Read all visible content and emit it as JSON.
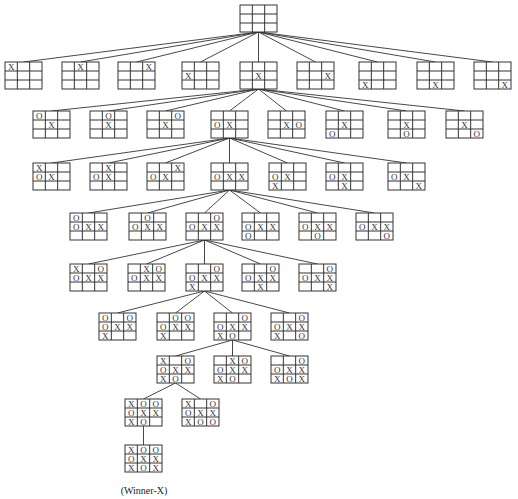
{
  "caption": "(Winner-X)",
  "colors": {
    "line": "#333333",
    "mark": "#333333",
    "background": "#ffffff"
  },
  "levels": [
    {
      "boards": [
        {
          "id": "root",
          "cells": [
            "",
            "",
            "",
            "",
            "",
            "",
            "",
            "",
            ""
          ]
        }
      ]
    },
    {
      "parent": "root",
      "boards": [
        {
          "id": "L1-0",
          "cells": [
            "X",
            "",
            "",
            "",
            "",
            "",
            "",
            "",
            ""
          ]
        },
        {
          "id": "L1-1",
          "cells": [
            "",
            "X",
            "",
            "",
            "",
            "",
            "",
            "",
            ""
          ]
        },
        {
          "id": "L1-2",
          "cells": [
            "",
            "",
            "X",
            "",
            "",
            "",
            "",
            "",
            ""
          ]
        },
        {
          "id": "L1-3",
          "cells": [
            "",
            "",
            "",
            "X",
            "",
            "",
            "",
            "",
            ""
          ]
        },
        {
          "id": "L1-4",
          "cells": [
            "",
            "",
            "",
            "",
            "X",
            "",
            "",
            "",
            ""
          ]
        },
        {
          "id": "L1-5",
          "cells": [
            "",
            "",
            "",
            "",
            "",
            "X",
            "",
            "",
            ""
          ]
        },
        {
          "id": "L1-6",
          "cells": [
            "",
            "",
            "",
            "",
            "",
            "",
            "X",
            "",
            ""
          ]
        },
        {
          "id": "L1-7",
          "cells": [
            "",
            "",
            "",
            "",
            "",
            "",
            "",
            "X",
            ""
          ]
        },
        {
          "id": "L1-8",
          "cells": [
            "",
            "",
            "",
            "",
            "",
            "",
            "",
            "",
            "X"
          ]
        }
      ]
    },
    {
      "parent": "L1-4",
      "boards": [
        {
          "id": "L2-0",
          "cells": [
            "O",
            "",
            "",
            "",
            "X",
            "",
            "",
            "",
            ""
          ]
        },
        {
          "id": "L2-1",
          "cells": [
            "",
            "O",
            "",
            "",
            "X",
            "",
            "",
            "",
            ""
          ]
        },
        {
          "id": "L2-2",
          "cells": [
            "",
            "",
            "O",
            "",
            "X",
            "",
            "",
            "",
            ""
          ]
        },
        {
          "id": "L2-3",
          "cells": [
            "",
            "",
            "",
            "O",
            "X",
            "",
            "",
            "",
            ""
          ]
        },
        {
          "id": "L2-4",
          "cells": [
            "",
            "",
            "",
            "",
            "X",
            "O",
            "",
            "",
            ""
          ]
        },
        {
          "id": "L2-5",
          "cells": [
            "",
            "",
            "",
            "",
            "X",
            "",
            "O",
            "",
            ""
          ]
        },
        {
          "id": "L2-6",
          "cells": [
            "",
            "",
            "",
            "",
            "X",
            "",
            "",
            "O",
            ""
          ]
        },
        {
          "id": "L2-7",
          "cells": [
            "",
            "",
            "",
            "",
            "X",
            "",
            "",
            "",
            "O"
          ]
        }
      ]
    },
    {
      "parent": "L2-3",
      "boards": [
        {
          "id": "L3-0",
          "cells": [
            "X",
            "",
            "",
            "O",
            "X",
            "",
            "",
            "",
            ""
          ]
        },
        {
          "id": "L3-1",
          "cells": [
            "",
            "X",
            "",
            "O",
            "X",
            "",
            "",
            "",
            ""
          ]
        },
        {
          "id": "L3-2",
          "cells": [
            "",
            "",
            "X",
            "O",
            "X",
            "",
            "",
            "",
            ""
          ]
        },
        {
          "id": "L3-3",
          "cells": [
            "",
            "",
            "",
            "O",
            "X",
            "X",
            "",
            "",
            ""
          ]
        },
        {
          "id": "L3-4",
          "cells": [
            "",
            "",
            "",
            "O",
            "X",
            "",
            "X",
            "",
            ""
          ]
        },
        {
          "id": "L3-5",
          "cells": [
            "",
            "",
            "",
            "O",
            "X",
            "",
            "",
            "X",
            ""
          ]
        },
        {
          "id": "L3-6",
          "cells": [
            "",
            "",
            "",
            "O",
            "X",
            "",
            "",
            "",
            "X"
          ]
        }
      ]
    },
    {
      "parent": "L3-3",
      "boards": [
        {
          "id": "L4-0",
          "cells": [
            "O",
            "",
            "",
            "O",
            "X",
            "X",
            "",
            "",
            ""
          ]
        },
        {
          "id": "L4-1",
          "cells": [
            "",
            "O",
            "",
            "O",
            "X",
            "X",
            "",
            "",
            ""
          ]
        },
        {
          "id": "L4-2",
          "cells": [
            "",
            "",
            "O",
            "O",
            "X",
            "X",
            "",
            "",
            ""
          ]
        },
        {
          "id": "L4-3",
          "cells": [
            "",
            "",
            "",
            "O",
            "X",
            "X",
            "O",
            "",
            ""
          ]
        },
        {
          "id": "L4-4",
          "cells": [
            "",
            "",
            "",
            "O",
            "X",
            "X",
            "",
            "O",
            ""
          ]
        },
        {
          "id": "L4-5",
          "cells": [
            "",
            "",
            "",
            "O",
            "X",
            "X",
            "",
            "",
            "O"
          ]
        }
      ]
    },
    {
      "parent": "L4-2",
      "boards": [
        {
          "id": "L5-0",
          "cells": [
            "X",
            "",
            "O",
            "O",
            "X",
            "X",
            "",
            "",
            ""
          ]
        },
        {
          "id": "L5-1",
          "cells": [
            "",
            "X",
            "O",
            "O",
            "X",
            "X",
            "",
            "",
            ""
          ]
        },
        {
          "id": "L5-2",
          "cells": [
            "",
            "",
            "O",
            "O",
            "X",
            "X",
            "X",
            "",
            ""
          ]
        },
        {
          "id": "L5-3",
          "cells": [
            "",
            "",
            "O",
            "O",
            "X",
            "X",
            "",
            "X",
            ""
          ]
        },
        {
          "id": "L5-4",
          "cells": [
            "",
            "",
            "O",
            "O",
            "X",
            "X",
            "",
            "",
            "X"
          ]
        }
      ]
    },
    {
      "parent": "L5-2",
      "boards": [
        {
          "id": "L6-0",
          "cells": [
            "O",
            "",
            "O",
            "O",
            "X",
            "X",
            "X",
            "",
            ""
          ]
        },
        {
          "id": "L6-1",
          "cells": [
            "",
            "O",
            "O",
            "O",
            "X",
            "X",
            "X",
            "",
            ""
          ]
        },
        {
          "id": "L6-2",
          "cells": [
            "",
            "",
            "O",
            "O",
            "X",
            "X",
            "X",
            "O",
            ""
          ]
        },
        {
          "id": "L6-3",
          "cells": [
            "",
            "",
            "O",
            "O",
            "X",
            "X",
            "X",
            "",
            "O"
          ]
        }
      ]
    },
    {
      "parent": "L6-2",
      "boards": [
        {
          "id": "L7-0",
          "cells": [
            "X",
            "",
            "O",
            "O",
            "X",
            "X",
            "X",
            "O",
            ""
          ]
        },
        {
          "id": "L7-1",
          "cells": [
            "",
            "X",
            "O",
            "O",
            "X",
            "X",
            "X",
            "O",
            ""
          ]
        },
        {
          "id": "L7-2",
          "cells": [
            "",
            "",
            "O",
            "O",
            "X",
            "X",
            "X",
            "O",
            "X"
          ]
        }
      ]
    },
    {
      "parent": "L7-0",
      "boards": [
        {
          "id": "L8-0",
          "cells": [
            "X",
            "O",
            "O",
            "O",
            "X",
            "X",
            "X",
            "O",
            ""
          ]
        },
        {
          "id": "L8-1",
          "cells": [
            "X",
            "",
            "O",
            "O",
            "X",
            "X",
            "X",
            "O",
            "O"
          ]
        }
      ]
    },
    {
      "parent": "L8-0",
      "boards": [
        {
          "id": "L9-0",
          "cells": [
            "X",
            "O",
            "O",
            "O",
            "X",
            "X",
            "X",
            "O",
            "X"
          ]
        }
      ]
    }
  ]
}
